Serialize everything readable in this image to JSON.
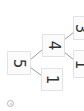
{
  "diagram": {
    "type": "tree",
    "orientation": "rotated-90",
    "nodes": [
      {
        "id": "n5",
        "label": "5"
      },
      {
        "id": "n4",
        "label": "4"
      },
      {
        "id": "n1a",
        "label": "1"
      },
      {
        "id": "n3",
        "label": "3"
      },
      {
        "id": "n1b",
        "label": "1"
      }
    ],
    "edges": [
      {
        "from": "n5",
        "to": "n4"
      },
      {
        "from": "n5",
        "to": "n1a"
      },
      {
        "from": "n4",
        "to": "n3"
      },
      {
        "from": "n4",
        "to": "n1b"
      }
    ]
  },
  "footer": {
    "icon": "copyright-icon"
  },
  "colors": {
    "node_border": "#e2e2e2",
    "edge": "#9a9a9a",
    "text": "#333333"
  }
}
